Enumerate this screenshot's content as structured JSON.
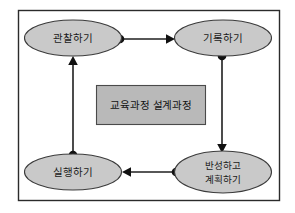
{
  "figure": {
    "title": "교육과정 설계과정",
    "frame": {
      "name": "diagram-frame",
      "x": 18,
      "y": 10,
      "width": 262,
      "height": 191,
      "border_color": "#2b2b2b",
      "background_color": "#ffffff"
    },
    "center_box": {
      "label": "교육과정 설계과정",
      "fill_color": "#b9b9b9",
      "border_color": "#4a4a4a",
      "x": 96,
      "y": 85,
      "width": 110,
      "height": 40
    },
    "nodes": [
      {
        "id": "observe",
        "label": "관찰하기",
        "lines": [
          "관찰하기"
        ],
        "cx": 73,
        "cy": 38,
        "rx": 49,
        "ry": 18,
        "fill_color": "#c9c9c9",
        "border_color": "#3b3b3b"
      },
      {
        "id": "record",
        "label": "기록하기",
        "lines": [
          "기록하기"
        ],
        "cx": 223,
        "cy": 38,
        "rx": 49,
        "ry": 18,
        "fill_color": "#c9c9c9",
        "border_color": "#3b3b3b"
      },
      {
        "id": "reflect-plan",
        "label": "반성하고 계획하기",
        "lines": [
          "반성하고",
          "계획하기"
        ],
        "cx": 223,
        "cy": 172,
        "rx": 49,
        "ry": 21,
        "fill_color": "#c9c9c9",
        "border_color": "#3b3b3b"
      },
      {
        "id": "implement",
        "label": "실행하기",
        "lines": [
          "실행하기"
        ],
        "cx": 73,
        "cy": 172,
        "rx": 49,
        "ry": 18,
        "fill_color": "#c9c9c9",
        "border_color": "#3b3b3b"
      }
    ],
    "edges": [
      {
        "id": "observe-to-record",
        "from": "observe",
        "to": "record",
        "direction": "right",
        "source_dot": {
          "cx": 120,
          "cy": 39
        },
        "line": {
          "x1": 120,
          "y1": 39,
          "x2": 171,
          "y2": 39
        },
        "arrow_at": {
          "x": 174,
          "y": 39
        },
        "color": "#1f1f1f"
      },
      {
        "id": "record-to-reflect-plan",
        "from": "record",
        "to": "reflect-plan",
        "direction": "down",
        "source_dot": {
          "cx": 222,
          "cy": 56
        },
        "line": {
          "x1": 222,
          "y1": 56,
          "x2": 222,
          "y2": 148
        },
        "arrow_at": {
          "x": 222,
          "y": 152
        },
        "color": "#1f1f1f"
      },
      {
        "id": "reflect-plan-to-implement",
        "from": "reflect-plan",
        "to": "implement",
        "direction": "left",
        "source_dot": {
          "cx": 176,
          "cy": 172
        },
        "line": {
          "x1": 176,
          "y1": 172,
          "x2": 127,
          "y2": 172
        },
        "arrow_at": {
          "x": 123,
          "y": 172
        },
        "color": "#1f1f1f"
      },
      {
        "id": "implement-to-observe",
        "from": "implement",
        "to": "observe",
        "direction": "up",
        "source_dot": {
          "cx": 73,
          "cy": 155
        },
        "line": {
          "x1": 73,
          "y1": 155,
          "x2": 73,
          "y2": 61
        },
        "arrow_at": {
          "x": 73,
          "y": 57
        },
        "color": "#1f1f1f"
      }
    ]
  }
}
